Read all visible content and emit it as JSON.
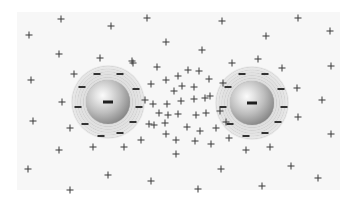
{
  "figure": {
    "colors": {
      "background": "#ffffff",
      "panel": "#f7f7f7",
      "charge_mark": "#333333",
      "sphere_highlight": "#fbfbfb",
      "sphere_shadow": "#6d6d6d"
    },
    "spheres": [
      {
        "name": "left-sphere",
        "cx": 108,
        "cy": 102,
        "r": 22,
        "halo_r": 37,
        "core_charge": "-",
        "minus_signs": [
          [
            97,
            74
          ],
          [
            120,
            74
          ],
          [
            82,
            87
          ],
          [
            136,
            89
          ],
          [
            78,
            107
          ],
          [
            139,
            107
          ],
          [
            85,
            124
          ],
          [
            133,
            122
          ],
          [
            101,
            136
          ],
          [
            120,
            133
          ]
        ]
      },
      {
        "name": "right-sphere",
        "cx": 252,
        "cy": 103,
        "r": 22,
        "halo_r": 37,
        "core_charge": "-",
        "minus_signs": [
          [
            242,
            74
          ],
          [
            265,
            74
          ],
          [
            228,
            87
          ],
          [
            281,
            89
          ],
          [
            223,
            107
          ],
          [
            284,
            107
          ],
          [
            230,
            124
          ],
          [
            278,
            122
          ],
          [
            246,
            136
          ],
          [
            265,
            133
          ]
        ]
      }
    ],
    "plus_signs": [
      [
        61,
        19
      ],
      [
        111,
        26
      ],
      [
        29,
        35
      ],
      [
        59,
        54
      ],
      [
        100,
        58
      ],
      [
        132,
        61
      ],
      [
        147,
        18
      ],
      [
        222,
        21
      ],
      [
        298,
        18
      ],
      [
        166,
        42
      ],
      [
        266,
        36
      ],
      [
        330,
        31
      ],
      [
        202,
        50
      ],
      [
        157,
        67
      ],
      [
        232,
        63
      ],
      [
        258,
        59
      ],
      [
        282,
        68
      ],
      [
        331,
        66
      ],
      [
        74,
        74
      ],
      [
        133,
        63
      ],
      [
        151,
        84
      ],
      [
        62,
        102
      ],
      [
        153,
        104
      ],
      [
        70,
        128
      ],
      [
        149,
        124
      ],
      [
        141,
        140
      ],
      [
        31,
        80
      ],
      [
        33,
        121
      ],
      [
        157,
        67
      ],
      [
        166,
        80
      ],
      [
        178,
        76
      ],
      [
        188,
        70
      ],
      [
        199,
        71
      ],
      [
        209,
        79
      ],
      [
        174,
        91
      ],
      [
        182,
        86
      ],
      [
        194,
        87
      ],
      [
        210,
        96
      ],
      [
        223,
        83
      ],
      [
        145,
        100
      ],
      [
        167,
        104
      ],
      [
        181,
        101
      ],
      [
        194,
        99
      ],
      [
        205,
        98
      ],
      [
        159,
        113
      ],
      [
        168,
        115
      ],
      [
        178,
        114
      ],
      [
        196,
        115
      ],
      [
        206,
        113
      ],
      [
        220,
        111
      ],
      [
        154,
        125
      ],
      [
        165,
        123
      ],
      [
        187,
        127
      ],
      [
        200,
        131
      ],
      [
        216,
        128
      ],
      [
        226,
        122
      ],
      [
        166,
        134
      ],
      [
        176,
        140
      ],
      [
        195,
        141
      ],
      [
        211,
        144
      ],
      [
        229,
        138
      ],
      [
        297,
        88
      ],
      [
        322,
        100
      ],
      [
        298,
        117
      ],
      [
        331,
        134
      ],
      [
        59,
        150
      ],
      [
        93,
        147
      ],
      [
        124,
        147
      ],
      [
        176,
        154
      ],
      [
        246,
        150
      ],
      [
        270,
        147
      ],
      [
        28,
        169
      ],
      [
        108,
        175
      ],
      [
        151,
        181
      ],
      [
        221,
        169
      ],
      [
        291,
        166
      ],
      [
        318,
        178
      ],
      [
        70,
        190
      ],
      [
        198,
        189
      ],
      [
        262,
        186
      ]
    ]
  }
}
